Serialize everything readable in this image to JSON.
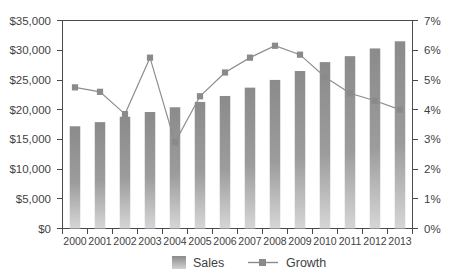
{
  "chart_data": {
    "type": "bar",
    "title": "",
    "subtitle": "",
    "xlabel": "",
    "ylabel": "",
    "grid": false,
    "legend_position": "bottom",
    "categories": [
      "2000",
      "2001",
      "2002",
      "2003",
      "2004",
      "2005",
      "2006",
      "2007",
      "2008",
      "2009",
      "2010",
      "2011",
      "2012",
      "2013"
    ],
    "series": [
      {
        "name": "Sales",
        "type": "bar",
        "axis": "left",
        "color": "#8e8e8e",
        "values": [
          17200,
          17900,
          18800,
          19600,
          20400,
          21300,
          22300,
          23700,
          25000,
          26500,
          28000,
          29000,
          30300,
          31500
        ]
      },
      {
        "name": "Growth",
        "type": "line",
        "axis": "right",
        "color": "#8a8a8a",
        "values": [
          4.75,
          4.6,
          3.85,
          5.75,
          2.9,
          4.45,
          5.25,
          5.75,
          6.15,
          5.85,
          5.1,
          4.55,
          4.3,
          4.0
        ]
      }
    ],
    "left_axis": {
      "min": 0,
      "max": 35000,
      "step": 5000,
      "tick_labels": [
        "$0",
        "$5,000",
        "$10,000",
        "$15,000",
        "$20,000",
        "$25,000",
        "$30,000",
        "$35,000"
      ]
    },
    "right_axis": {
      "min": 0,
      "max": 7,
      "step": 1,
      "tick_labels": [
        "0%",
        "1%",
        "2%",
        "3%",
        "4%",
        "5%",
        "6%",
        "7%"
      ]
    }
  },
  "legend": {
    "items": [
      {
        "label": "Sales",
        "marker": "bar-swatch"
      },
      {
        "label": "Growth",
        "marker": "line-square-marker"
      }
    ]
  }
}
